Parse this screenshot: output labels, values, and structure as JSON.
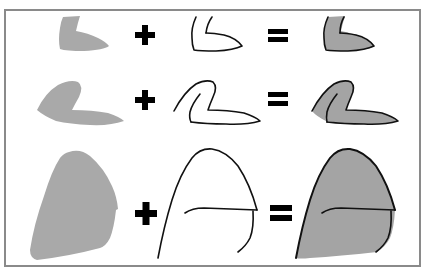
{
  "diagram": {
    "description": "Fill shape plus outline strokes equals combined shaded drawing",
    "colors": {
      "frame_border": "#8a8a8a",
      "fill_plain": "#a9a9a9",
      "fill_combined": "#a4a4a4",
      "stroke": "#111111",
      "operator": "#000000",
      "background": "#ffffff"
    },
    "operators": {
      "plus": "+",
      "equals": "="
    },
    "rows": [
      {
        "id": "row-small",
        "size": "small",
        "parts": [
          "fill shape",
          "outline",
          "combined"
        ],
        "shape": "L-shaped boot form"
      },
      {
        "id": "row-medium",
        "size": "medium",
        "parts": [
          "fill shape",
          "outline",
          "combined"
        ],
        "shape": "curled hook form"
      },
      {
        "id": "row-large",
        "size": "large",
        "parts": [
          "fill shape",
          "outline",
          "combined"
        ],
        "shape": "rounded blob form with cross stroke"
      }
    ]
  }
}
